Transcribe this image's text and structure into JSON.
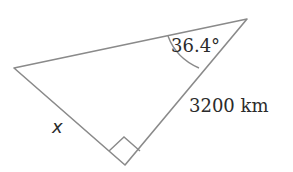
{
  "diagram": {
    "type": "right-triangle",
    "vertices": {
      "top_right": [
        247,
        19
      ],
      "left": [
        14,
        68
      ],
      "right_angle": [
        125,
        165
      ]
    },
    "labels": {
      "angle": "36.4°",
      "hypotenuse_side": "3200 km",
      "unknown_side": "x"
    },
    "colors": {
      "stroke": "#8a8a8a",
      "text": "#2b2b2b",
      "background": "#ffffff"
    }
  }
}
